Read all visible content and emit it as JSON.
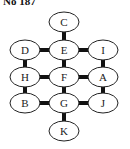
{
  "title": "No 187",
  "nodes": [
    {
      "id": "C",
      "label": "C",
      "row": 0,
      "col": 1
    },
    {
      "id": "D",
      "label": "D",
      "row": 1,
      "col": 0
    },
    {
      "id": "E",
      "label": "E",
      "row": 1,
      "col": 1
    },
    {
      "id": "I",
      "label": "I",
      "row": 1,
      "col": 2
    },
    {
      "id": "H",
      "label": "H",
      "row": 2,
      "col": 0
    },
    {
      "id": "F",
      "label": "F",
      "row": 2,
      "col": 1
    },
    {
      "id": "A",
      "label": "A",
      "row": 2,
      "col": 2
    },
    {
      "id": "B",
      "label": "B",
      "row": 3,
      "col": 0
    },
    {
      "id": "G",
      "label": "G",
      "row": 3,
      "col": 1
    },
    {
      "id": "J",
      "label": "J",
      "row": 3,
      "col": 2
    },
    {
      "id": "K",
      "label": "K",
      "row": 4,
      "col": 1
    }
  ],
  "edges": [
    [
      "C",
      "E"
    ],
    [
      "D",
      "E"
    ],
    [
      "E",
      "I"
    ],
    [
      "D",
      "H"
    ],
    [
      "E",
      "F"
    ],
    [
      "I",
      "A"
    ],
    [
      "H",
      "F"
    ],
    [
      "F",
      "A"
    ],
    [
      "H",
      "B"
    ],
    [
      "F",
      "G"
    ],
    [
      "A",
      "J"
    ],
    [
      "B",
      "G"
    ],
    [
      "G",
      "J"
    ],
    [
      "G",
      "K"
    ]
  ]
}
